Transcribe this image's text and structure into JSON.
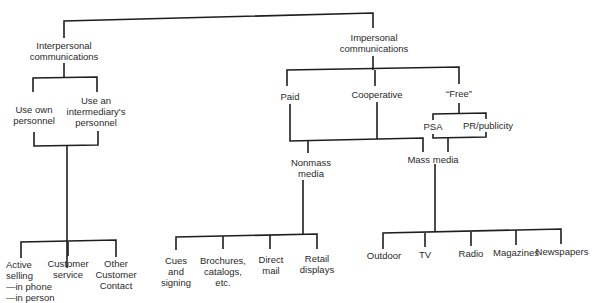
{
  "diagram": {
    "root_branches": {
      "interpersonal": "Interpersonal\ncommunications",
      "impersonal": "Impersonal\ncommunications"
    },
    "interpersonal": {
      "use_own": "Use own\npersonnel",
      "use_intermediary": "Use an\nintermediary's\npersonnel",
      "leaves": {
        "active_selling": "Active\nselling\n—in phone\n—in person",
        "customer_service": "Customer\nservice",
        "other_contact": "Other\nCustomer\nContact"
      }
    },
    "impersonal": {
      "paid": "Paid",
      "cooperative": "Cooperative",
      "free": "“Free”",
      "psa": "PSA",
      "pr": "PR/publicity",
      "nonmass": "Nonmass\nmedia",
      "mass": "Mass media",
      "nonmass_leaves": {
        "cues": "Cues\nand\nsigning",
        "brochures": "Brochures,\ncatalogs,\netc.",
        "direct_mail": "Direct\nmail",
        "retail": "Retail\ndisplays"
      },
      "mass_leaves": {
        "outdoor": "Outdoor",
        "tv": "TV",
        "radio": "Radio",
        "magazines": "Magazines",
        "newspapers": "Newspapers"
      }
    }
  }
}
